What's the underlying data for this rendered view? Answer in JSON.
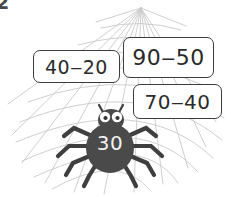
{
  "worksheet": {
    "item_number": "2",
    "background": {
      "web_color": "#c9c9c9",
      "page_color": "#ffffff"
    },
    "spider": {
      "name": "spider-icon",
      "body_color": "#4a4a4a",
      "value": "30",
      "value_color": "#f2f2f2",
      "eye_color": "#ffffff",
      "pupil_color": "#333333"
    },
    "expression_boxes": [
      {
        "id": "box-1",
        "expression": "40‒20",
        "minuend": 40,
        "subtrahend": 20,
        "result": 20,
        "border_color": "#3c3c3c"
      },
      {
        "id": "box-2",
        "expression": "90‒50",
        "minuend": 90,
        "subtrahend": 50,
        "result": 40,
        "border_color": "#3c3c3c"
      },
      {
        "id": "box-3",
        "expression": "70‒40",
        "minuend": 70,
        "subtrahend": 40,
        "result": 30,
        "border_color": "#3c3c3c"
      }
    ]
  }
}
